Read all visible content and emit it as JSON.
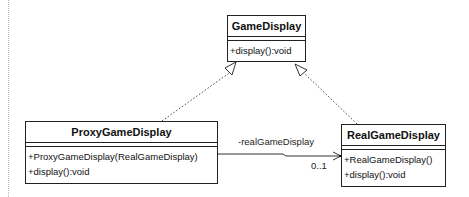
{
  "diagram": {
    "type": "UML class diagram",
    "classes": [
      {
        "id": "game-display",
        "name": "GameDisplay",
        "attributes": [],
        "operations": [
          "+display():void"
        ]
      },
      {
        "id": "proxy-game-display",
        "name": "ProxyGameDisplay",
        "attributes": [],
        "operations": [
          "+ProxyGameDisplay(RealGameDisplay)",
          "+display():void"
        ]
      },
      {
        "id": "real-game-display",
        "name": "RealGameDisplay",
        "attributes": [],
        "operations": [
          "+RealGameDisplay()",
          "+display():void"
        ]
      }
    ],
    "relationships": [
      {
        "type": "realization",
        "from": "ProxyGameDisplay",
        "to": "GameDisplay"
      },
      {
        "type": "realization",
        "from": "RealGameDisplay",
        "to": "GameDisplay"
      },
      {
        "type": "directed-association",
        "from": "ProxyGameDisplay",
        "to": "RealGameDisplay",
        "role": "-realGameDisplay",
        "multiplicity": "0..1"
      }
    ]
  }
}
